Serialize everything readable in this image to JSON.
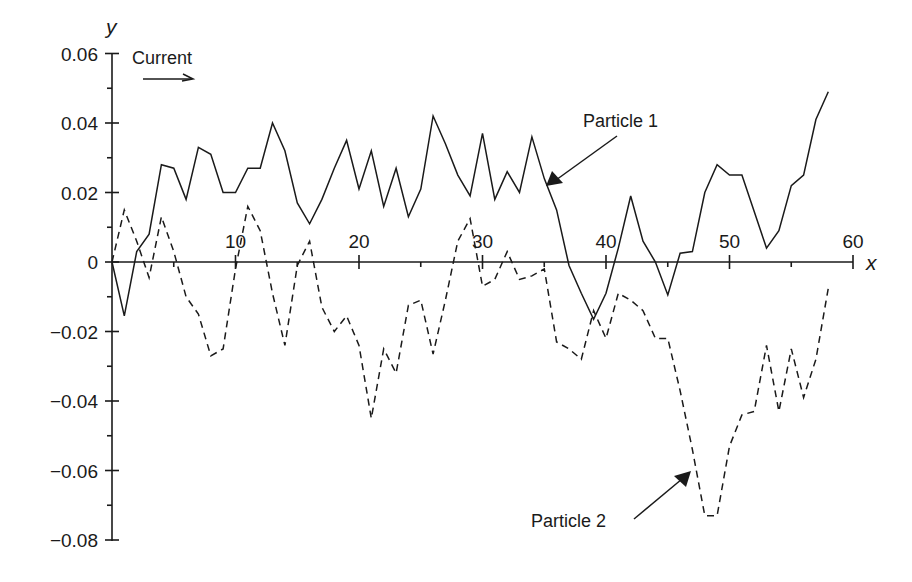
{
  "chart_data": {
    "type": "line",
    "title": "",
    "xlabel": "x",
    "ylabel": "y",
    "xlim": [
      0,
      60
    ],
    "ylim": [
      -0.08,
      0.06
    ],
    "grid": false,
    "x_ticks": [
      10,
      20,
      30,
      40,
      50,
      60
    ],
    "x_tick_labels": [
      "10",
      "20",
      "30",
      "40",
      "50",
      "60"
    ],
    "y_ticks": [
      0.06,
      0.04,
      0.02,
      0,
      -0.02,
      -0.04,
      -0.06,
      -0.08
    ],
    "y_tick_labels": [
      "0.06",
      "0.04",
      "0.02",
      "0",
      "−0.02",
      "−0.04",
      "−0.06",
      "−0.08"
    ],
    "x": [
      0,
      1,
      2,
      3,
      4,
      5,
      6,
      7,
      8,
      9,
      10,
      11,
      12,
      13,
      14,
      15,
      16,
      17,
      18,
      19,
      20,
      21,
      22,
      23,
      24,
      25,
      26,
      27,
      28,
      29,
      30,
      31,
      32,
      33,
      34,
      35,
      36,
      37,
      38,
      39,
      40,
      41,
      42,
      43,
      44,
      45,
      46,
      47,
      48,
      49,
      50,
      51,
      52,
      53,
      54,
      55,
      56,
      57,
      58
    ],
    "series": [
      {
        "name": "Particle 1",
        "style": "solid",
        "values": [
          0,
          -0.0155,
          0.003,
          0.008,
          0.028,
          0.027,
          0.018,
          0.033,
          0.031,
          0.02,
          0.02,
          0.027,
          0.027,
          0.04,
          0.032,
          0.017,
          0.011,
          0.018,
          0.027,
          0.035,
          0.021,
          0.032,
          0.016,
          0.027,
          0.013,
          0.021,
          0.042,
          0.034,
          0.025,
          0.019,
          0.037,
          0.018,
          0.026,
          0.02,
          0.036,
          0.024,
          0.015,
          -0.001,
          -0.009,
          -0.0165,
          -0.009,
          0.004,
          0.019,
          0.006,
          0.0,
          -0.0095,
          0.0025,
          0.003,
          0.02,
          0.028,
          0.025,
          0.025,
          0.0145,
          0.004,
          0.009,
          0.022,
          0.025,
          0.041,
          0.049
        ]
      },
      {
        "name": "Particle 2",
        "style": "dashed",
        "values": [
          0,
          0.015,
          0.006,
          -0.0045,
          0.013,
          0.003,
          -0.01,
          -0.015,
          -0.027,
          -0.025,
          -0.002,
          0.016,
          0.009,
          -0.009,
          -0.024,
          -0.001,
          0.006,
          -0.013,
          -0.02,
          -0.0155,
          -0.024,
          -0.045,
          -0.025,
          -0.032,
          -0.0125,
          -0.011,
          -0.0265,
          -0.011,
          0.006,
          0.0125,
          -0.007,
          -0.005,
          0.003,
          -0.005,
          -0.004,
          -0.002,
          -0.023,
          -0.025,
          -0.028,
          -0.014,
          -0.022,
          -0.009,
          -0.011,
          -0.014,
          -0.022,
          -0.022,
          -0.037,
          -0.054,
          -0.073,
          -0.073,
          -0.053,
          -0.044,
          -0.043,
          -0.024,
          -0.043,
          -0.025,
          -0.039,
          -0.028,
          -0.0075
        ]
      }
    ],
    "annotations": [
      {
        "text": "Current",
        "type": "arrow-right",
        "note": "flow direction arrow under label"
      },
      {
        "text": "Particle 1",
        "points_to": [
          35,
          0.024
        ]
      },
      {
        "text": "Particle 2",
        "points_to": [
          47,
          -0.059
        ]
      }
    ],
    "legend": "none (inline labels with arrows)"
  },
  "labels": {
    "y_axis": "y",
    "x_axis": "x",
    "current": "Current",
    "particle1": "Particle 1",
    "particle2": "Particle 2"
  }
}
